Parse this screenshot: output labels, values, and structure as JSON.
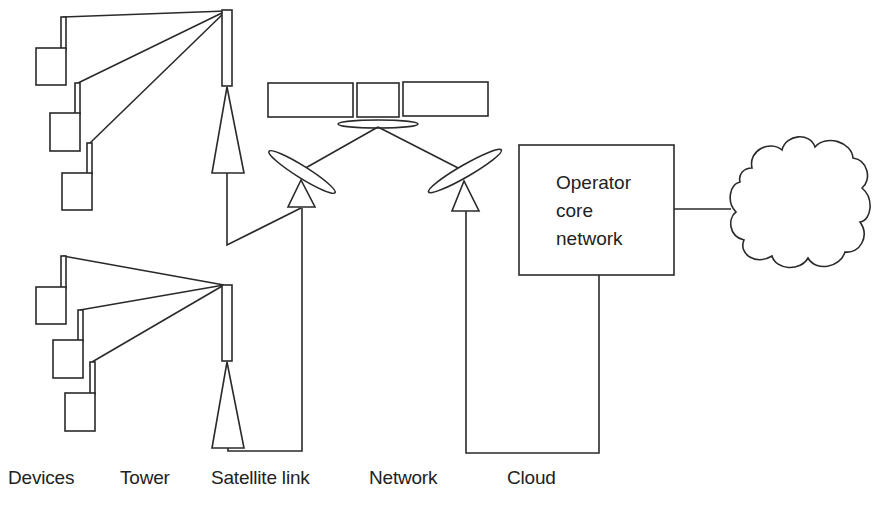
{
  "diagram": {
    "core_box": {
      "line1": "Operator",
      "line2": "core",
      "line3": "network"
    },
    "labels": {
      "devices": "Devices",
      "tower": "Tower",
      "satellite_link": "Satellite link",
      "network": "Network",
      "cloud": "Cloud"
    },
    "colors": {
      "stroke": "#2a2a2a",
      "background": "#ffffff"
    }
  }
}
